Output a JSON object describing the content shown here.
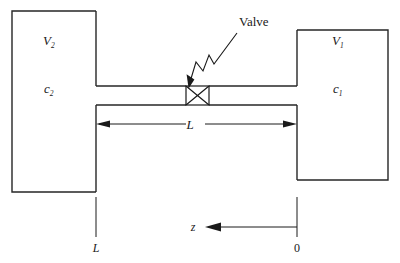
{
  "figure": {
    "background_color": "#ffffff",
    "line_color": "#262626"
  },
  "labels": {
    "valve_callout": "Valve",
    "left_vessel_volume": "V",
    "left_vessel_volume_sub": "2",
    "left_vessel_conc": "c",
    "left_vessel_conc_sub": "2",
    "right_vessel_volume": "V",
    "right_vessel_volume_sub": "1",
    "right_vessel_conc": "c",
    "right_vessel_conc_sub": "1",
    "pipe_length": "L",
    "axis_name": "z",
    "axis_tick_left": "L",
    "axis_tick_right": "0"
  },
  "elements": {
    "left_vessel_name": "left-vessel",
    "right_vessel_name": "right-vessel",
    "pipe_name": "connecting-pipe",
    "valve_name": "valve-symbol",
    "dimension_name": "pipe-length-dimension",
    "axis_name": "z-coordinate-axis"
  }
}
